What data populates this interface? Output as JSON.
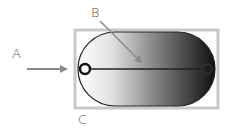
{
  "diagram": {
    "labels": {
      "a": "A",
      "b": "B",
      "c": "C"
    },
    "colors": {
      "frame": "#c8c8c8",
      "arrow": "#8a8a8a",
      "outline": "#222222",
      "gradient_start": "#ffffff",
      "gradient_end": "#111111",
      "label": "#555555"
    },
    "elements": {
      "frame": "rectangle-frame",
      "capsule": "gradient-capsule",
      "axis_line": "horizontal-center-line",
      "left_ring": "left-ring-marker",
      "right_ring": "right-ring-marker",
      "arrow_a": "arrow-pointing-to-left-ring",
      "arrow_b": "arrow-pointing-to-center-line"
    }
  }
}
